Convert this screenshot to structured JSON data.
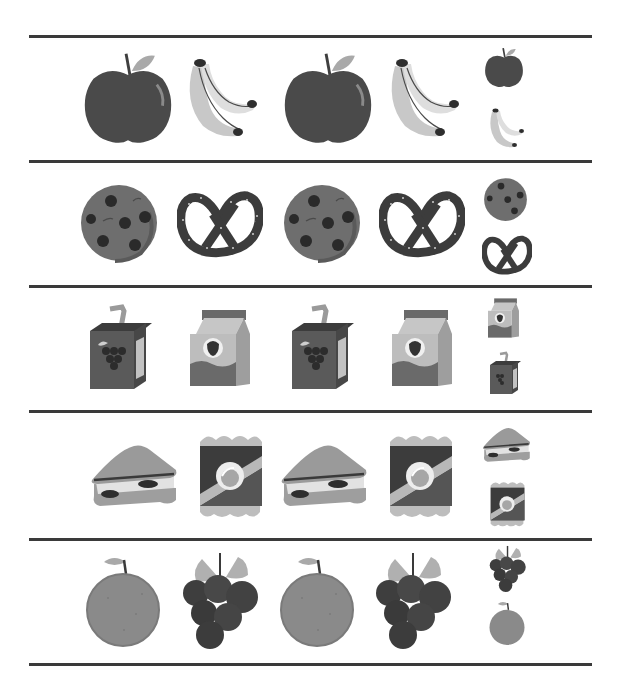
{
  "worksheet": {
    "header_text": "",
    "rule_color": "#3a3a3a",
    "rows": [
      {
        "name": "apple-banana",
        "pattern": [
          "apple",
          "banana",
          "apple",
          "banana"
        ],
        "choices": [
          "apple",
          "banana"
        ]
      },
      {
        "name": "cookie-pretzel",
        "pattern": [
          "cookie",
          "pretzel",
          "cookie",
          "pretzel"
        ],
        "choices": [
          "cookie",
          "pretzel"
        ]
      },
      {
        "name": "juicebox-milkcarton",
        "pattern": [
          "juice-box",
          "milk-carton",
          "juice-box",
          "milk-carton"
        ],
        "choices": [
          "milk-carton",
          "juice-box"
        ]
      },
      {
        "name": "sandwich-chips",
        "pattern": [
          "sandwich",
          "chips-bag",
          "sandwich",
          "chips-bag"
        ],
        "choices": [
          "sandwich",
          "chips-bag"
        ]
      },
      {
        "name": "orange-grapes",
        "pattern": [
          "orange",
          "grapes",
          "orange",
          "grapes"
        ],
        "choices": [
          "grapes",
          "orange"
        ]
      }
    ]
  },
  "palette": {
    "dark": "#3f3f3f",
    "mid": "#6b6b6b",
    "light": "#a9a9a9",
    "pale": "#d6d6d6"
  }
}
